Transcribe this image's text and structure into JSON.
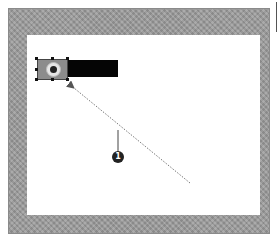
{
  "diagram": {
    "frame": {
      "color": "#9a9a9a",
      "canvas_color": "#ffffff"
    },
    "selected_element": {
      "icon": "camera-lens-icon",
      "bar_color": "#050505"
    },
    "arrow": {
      "style": "dotted",
      "from": [
        190,
        183
      ],
      "to": [
        70,
        85
      ]
    },
    "callout": {
      "number": "1"
    }
  }
}
